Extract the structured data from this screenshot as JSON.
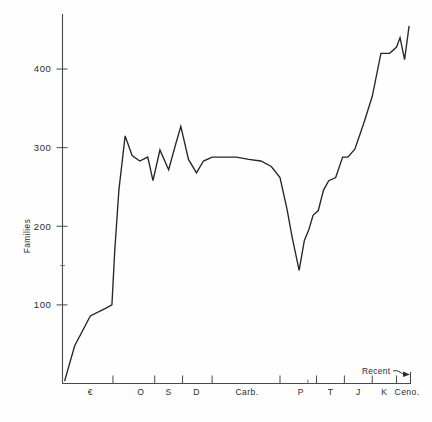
{
  "chart_data": {
    "type": "line",
    "title": "",
    "subtitle": "",
    "xlabel": "",
    "ylabel": "Families",
    "ylim": [
      0,
      470
    ],
    "yticks": [
      100,
      200,
      300,
      400
    ],
    "ytick_labels": [
      "100",
      "200",
      "300",
      "400"
    ],
    "y_minor_ticks": [
      150
    ],
    "grid": false,
    "legend": null,
    "xlim": [
      0,
      100
    ],
    "x_period_labels": [
      "€",
      "O",
      "S",
      "D",
      "Carb.",
      "P",
      "T",
      "J",
      "K",
      "Ceno."
    ],
    "x_period_label_positions": [
      8.0,
      22.5,
      30.5,
      38.5,
      53.0,
      68.5,
      77.0,
      85.0,
      92.5,
      99.0
    ],
    "x_boundary_ticks": [
      0.0,
      14.5,
      26.5,
      34.5,
      43.0,
      62.5,
      70.5,
      73.0,
      81.0,
      89.0,
      96.0,
      100.0
    ],
    "x_minor_boundary_ticks": [
      70.5
    ],
    "annotations": [
      {
        "text": "Recent",
        "x": 95.5,
        "y": 455,
        "arrow": "curved-right"
      }
    ],
    "series": [
      {
        "name": "Marine family diversity",
        "x": [
          0.6,
          3.5,
          8.0,
          12.5,
          14.2,
          15.0,
          16.2,
          18.0,
          20.0,
          22.2,
          24.5,
          26.0,
          28.0,
          30.5,
          32.5,
          34.0,
          36.2,
          38.5,
          40.5,
          43.0,
          46.5,
          50.0,
          53.5,
          57.0,
          60.0,
          62.5,
          64.5,
          66.0,
          68.0,
          69.5,
          70.8,
          72.0,
          73.5,
          75.0,
          76.5,
          78.5,
          80.5,
          82.0,
          84.0,
          86.5,
          89.0,
          91.5,
          94.0,
          96.0,
          97.0,
          98.3,
          99.6
        ],
        "values": [
          3,
          48,
          86,
          96,
          100,
          168,
          246,
          315,
          290,
          283,
          288,
          258,
          297,
          272,
          304,
          327,
          285,
          268,
          283,
          288,
          288,
          288,
          285,
          283,
          276,
          262,
          222,
          186,
          144,
          182,
          196,
          214,
          220,
          246,
          258,
          262,
          288,
          288,
          298,
          330,
          365,
          420,
          420,
          428,
          440,
          412,
          455
        ]
      }
    ]
  },
  "axes": {
    "y_axis_title": "Families"
  }
}
